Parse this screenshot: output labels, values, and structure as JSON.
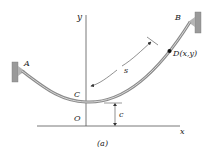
{
  "figure": {
    "caption": "(a)",
    "colors": {
      "cable": "#8a8a8a",
      "cable_highlight": "#d8d8d8",
      "support": "#9a9a9a",
      "axis": "#555555",
      "text": "#222222"
    }
  },
  "labels": {
    "point_a": "A",
    "point_b": "B",
    "point_c": "C",
    "origin": "O",
    "point_d": "D(x,y)",
    "arc_length": "s",
    "height": "c",
    "y_axis": "y",
    "x_axis": "x"
  }
}
